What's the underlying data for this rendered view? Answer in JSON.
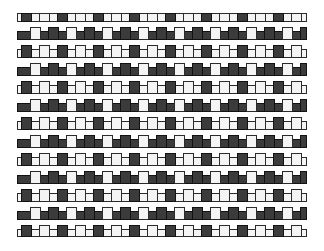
{
  "figure": {
    "type": "pattern-illustration",
    "background_color": "#ffffff",
    "canvas": {
      "width": 324,
      "height": 251
    }
  },
  "pattern": {
    "name": "basket-weave",
    "description": "Interlaced horizontal bars and vertical tiles alternating between dark and light, forming a woven texture.",
    "origin_x": 17,
    "origin_y": 13,
    "area_width": 290,
    "area_height": 224,
    "period_x": 18,
    "period_y": 18,
    "columns": 16,
    "rows": 13,
    "hbar_height": 9,
    "hbar_inset_x": 0,
    "vtile_width": 11,
    "vtile_height": 13,
    "vtile_offset_x": 4,
    "vtile_offset_y": -4,
    "outline_width": 1
  },
  "colors": {
    "dark_fill": "#3b3b3b",
    "light_fill": "#f4f4f4",
    "outline": "#1a1a1a",
    "dark_outline": "#121212",
    "light_outline": "#2b2b2b",
    "background": "#ffffff"
  },
  "legend": {
    "dark_label": "dark tile",
    "light_label": "light tile"
  }
}
